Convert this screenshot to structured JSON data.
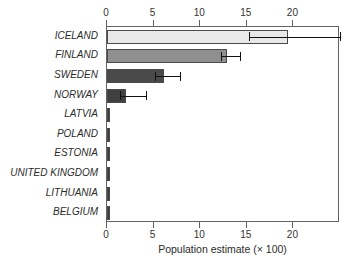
{
  "chart_data": {
    "type": "bar",
    "orientation": "horizontal",
    "title": "",
    "xlabel": "Population estimate (× 100)",
    "ylabel": "",
    "xlim": [
      0,
      25
    ],
    "xticks": [
      0,
      5,
      10,
      15,
      20
    ],
    "xtick_labels": [
      "0",
      "5",
      "10",
      "15",
      "20"
    ],
    "grid": false,
    "legend": null,
    "axis_top": true,
    "axis_bottom": true,
    "categories": [
      "ICELAND",
      "FINLAND",
      "SWEDEN",
      "NORWAY",
      "LATVIA",
      "POLAND",
      "ESTONIA",
      "UNITED KINGDOM",
      "LITHUANIA",
      "BELGIUM"
    ],
    "values": [
      19.4,
      12.9,
      6.1,
      2.0,
      0.28,
      0.12,
      0.1,
      0.1,
      0.1,
      0.1
    ],
    "error_low": [
      15.2,
      12.2,
      5.2,
      1.4,
      0.28,
      0.12,
      0.1,
      0.1,
      0.1,
      0.1
    ],
    "error_high": [
      25.0,
      14.3,
      7.8,
      4.2,
      0.28,
      0.12,
      0.1,
      0.1,
      0.1,
      0.1
    ],
    "bar_colors": [
      "#e9e9e9",
      "#8f8f8f",
      "#4a4a4a",
      "#404040",
      "#3f3f3f",
      "#3f3f3f",
      "#3f3f3f",
      "#3f3f3f",
      "#3f3f3f",
      "#3f3f3f"
    ],
    "bar_edge_color": "#4a4a4a",
    "error_color": "#111111",
    "axis_color": "#636363",
    "background_color": "#ffffff"
  }
}
